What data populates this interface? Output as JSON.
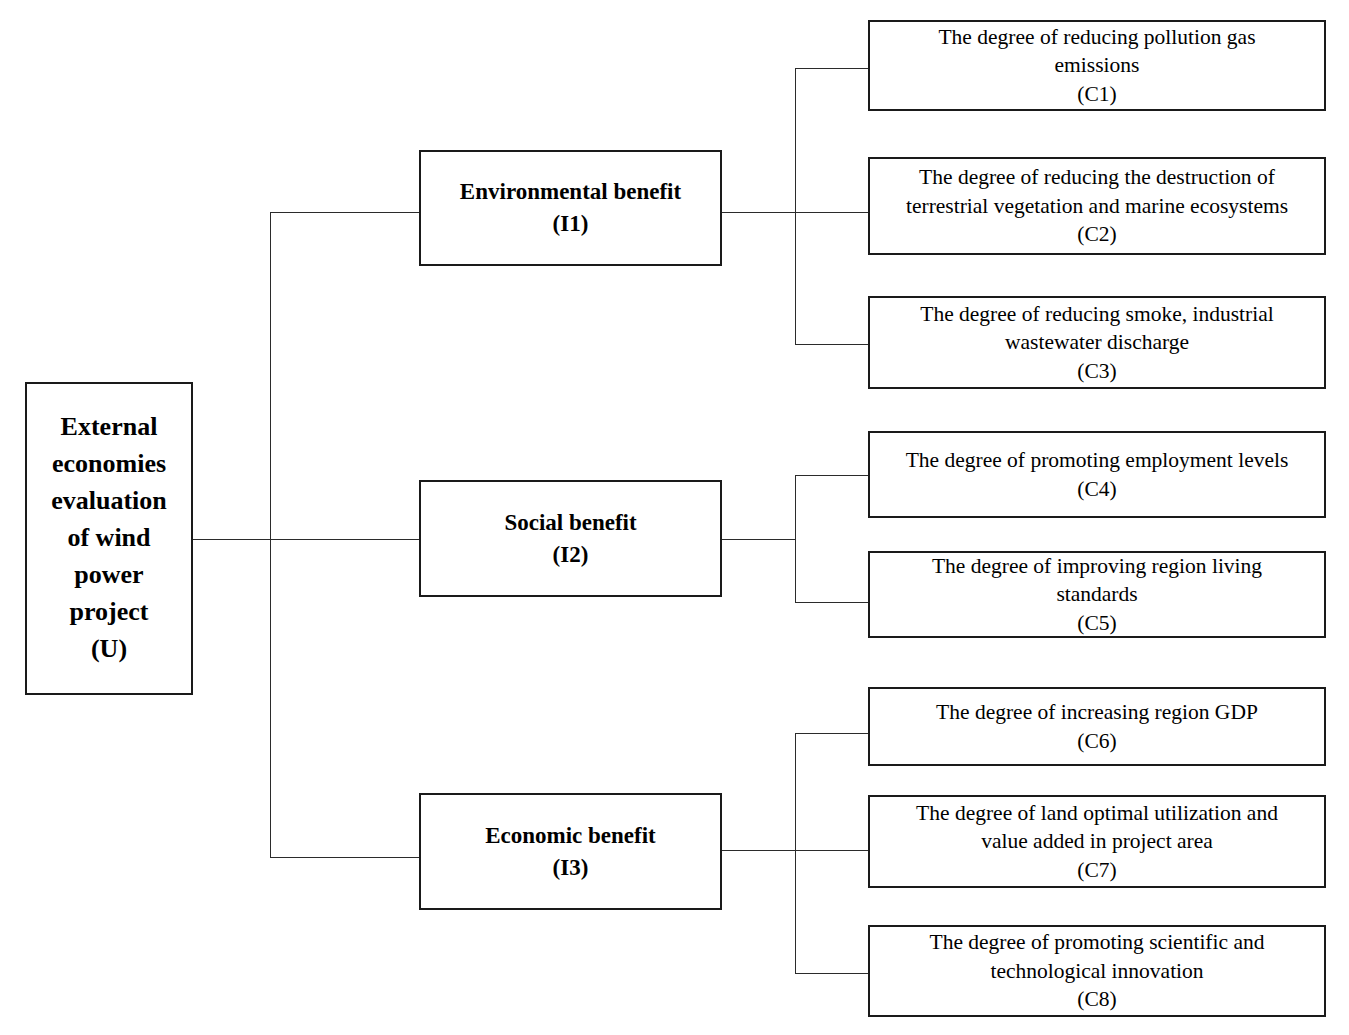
{
  "diagram": {
    "type": "hierarchy-tree",
    "orientation": "left-to-right",
    "colors": {
      "box_border": "#1a1a1a",
      "connector": "#2b2b2b",
      "background": "#ffffff",
      "text": "#000000"
    },
    "root": {
      "id": "U",
      "label": "External\neconomies\nevaluation\nof wind\npower\nproject\n(U)",
      "code": "(U)"
    },
    "criteria": [
      {
        "id": "I1",
        "label": "Environmental benefit\n(I1)",
        "code": "(I1)",
        "indicators": [
          {
            "id": "C1",
            "label": "The degree of reducing pollution gas\nemissions\n(C1)",
            "code": "(C1)"
          },
          {
            "id": "C2",
            "label": "The degree of reducing the destruction of\nterrestrial vegetation and marine ecosystems\n(C2)",
            "code": "(C2)"
          },
          {
            "id": "C3",
            "label": "The degree of reducing smoke, industrial\nwastewater discharge\n(C3)",
            "code": "(C3)"
          }
        ]
      },
      {
        "id": "I2",
        "label": "Social benefit\n(I2)",
        "code": "(I2)",
        "indicators": [
          {
            "id": "C4",
            "label": "The degree of promoting employment levels\n(C4)",
            "code": "(C4)"
          },
          {
            "id": "C5",
            "label": "The degree of improving region living\nstandards\n(C5)",
            "code": "(C5)"
          }
        ]
      },
      {
        "id": "I3",
        "label": "Economic benefit\n(I3)",
        "code": "(I3)",
        "indicators": [
          {
            "id": "C6",
            "label": "The degree of increasing region GDP\n(C6)",
            "code": "(C6)"
          },
          {
            "id": "C7",
            "label": "The degree of land optimal utilization and\nvalue added in project area\n(C7)",
            "code": "(C7)"
          },
          {
            "id": "C8",
            "label": "The degree of promoting scientific and\ntechnological innovation\n(C8)",
            "code": "(C8)"
          }
        ]
      }
    ]
  }
}
